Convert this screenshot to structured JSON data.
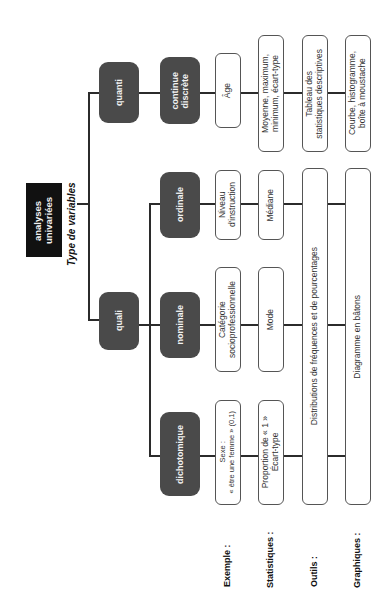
{
  "title": "analyses\nunivariées",
  "subtitle": "Type de variables",
  "categories": {
    "quanti": "quanti",
    "quali": "quali"
  },
  "types": {
    "continue": "continue\ndiscrète",
    "ordinale": "ordinale",
    "nominale": "nominale",
    "dichotomique": "dichotomique"
  },
  "row_labels": {
    "exemple": "Exemple :",
    "statistiques": "Statistiques :",
    "outils": "Outils :",
    "graphiques": "Graphiques :"
  },
  "examples": {
    "quanti": "Âge",
    "ordinale": "Niveau\nd'instruction",
    "nominale": "Catégorie\nsocioprofessionnelle",
    "dichotomique": "Sexe :\n« être une femme » (0,1)"
  },
  "statistics": {
    "quanti": "Moyenne, maximum,\nminimum, écart-type",
    "ordinale": "Médiane",
    "nominale": "Mode",
    "dichotomique": "Proportion de « 1 »\nÉcart-type"
  },
  "tools": {
    "quanti": "Tableau des\nstatistiques descriptives",
    "quali": "Distributions de fréquences et de pourcentages"
  },
  "graphics": {
    "quanti": "Courbe, histogramme,\nboîte à moustache",
    "quali": "Diagramme en bâtons"
  }
}
